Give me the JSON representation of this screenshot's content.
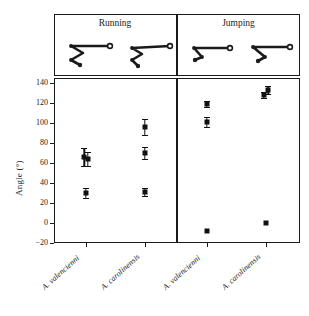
{
  "figure": {
    "y_axis_title": "Angle (°)",
    "degree_symbol": "°"
  },
  "panels": [
    {
      "id": "running",
      "title": "Running"
    },
    {
      "id": "jumping",
      "title": "Jumping"
    }
  ],
  "x_tick_labels": [
    "A. valencienni",
    "A. carolinensis",
    "A. valencienni",
    "A. carolinensis"
  ],
  "y_tick_labels": [
    "140",
    "120",
    "100",
    "80",
    "60",
    "40",
    "20",
    "0",
    "−20"
  ],
  "colors": {
    "ink": "#1a1a1a",
    "marker": "#111111",
    "background": "#ffffff"
  },
  "chart_data": {
    "type": "scatter",
    "title": "",
    "xlabel": "",
    "ylabel": "Angle (°)",
    "ylim": [
      -20,
      145
    ],
    "yticks": [
      -20,
      0,
      20,
      40,
      60,
      80,
      100,
      120,
      140
    ],
    "grid": false,
    "legend": "none",
    "panels": [
      "Running",
      "Jumping"
    ],
    "categories": [
      "A. valencienni",
      "A. carolinensis",
      "A. valencienni",
      "A. carolinensis"
    ],
    "points": [
      {
        "panel": "Running",
        "species": "A. valencienni",
        "x": 1,
        "x_offset": -0.04,
        "y": 66,
        "err": 9
      },
      {
        "panel": "Running",
        "species": "A. valencienni",
        "x": 1,
        "x_offset": 0.04,
        "y": 64,
        "err": 7
      },
      {
        "panel": "Running",
        "species": "A. valencienni",
        "x": 1,
        "x_offset": 0.0,
        "y": 30,
        "err": 5
      },
      {
        "panel": "Running",
        "species": "A. carolinensis",
        "x": 2,
        "x_offset": 0.0,
        "y": 96,
        "err": 8
      },
      {
        "panel": "Running",
        "species": "A. carolinensis",
        "x": 2,
        "x_offset": 0.0,
        "y": 70,
        "err": 6
      },
      {
        "panel": "Running",
        "species": "A. carolinensis",
        "x": 2,
        "x_offset": 0.0,
        "y": 31,
        "err": 4
      },
      {
        "panel": "Jumping",
        "species": "A. valencienni",
        "x": 3,
        "x_offset": 0.0,
        "y": 119,
        "err": 3
      },
      {
        "panel": "Jumping",
        "species": "A. valencienni",
        "x": 3,
        "x_offset": 0.0,
        "y": 101,
        "err": 5
      },
      {
        "panel": "Jumping",
        "species": "A. valencienni",
        "x": 3,
        "x_offset": 0.0,
        "y": -8,
        "err": 0
      },
      {
        "panel": "Jumping",
        "species": "A. carolinensis",
        "x": 4,
        "x_offset": 0.06,
        "y": 133,
        "err": 4
      },
      {
        "panel": "Jumping",
        "species": "A. carolinensis",
        "x": 4,
        "x_offset": -0.06,
        "y": 128,
        "err": 3
      },
      {
        "panel": "Jumping",
        "species": "A. carolinensis",
        "x": 4,
        "x_offset": 0.0,
        "y": 0,
        "err": 0
      }
    ]
  },
  "limb_diagrams": [
    {
      "panel": "Running",
      "species": "A. valencienni",
      "name": "limb-diagram-running-valencienni"
    },
    {
      "panel": "Running",
      "species": "A. carolinensis",
      "name": "limb-diagram-running-carolinensis"
    },
    {
      "panel": "Jumping",
      "species": "A. valencienni",
      "name": "limb-diagram-jumping-valencienni"
    },
    {
      "panel": "Jumping",
      "species": "A. carolinensis",
      "name": "limb-diagram-jumping-carolinensis"
    }
  ]
}
